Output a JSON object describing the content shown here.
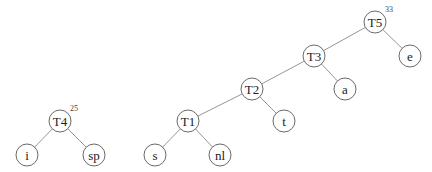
{
  "diagram": {
    "type": "huffman-trees",
    "nodes": [
      {
        "id": "T5",
        "label": "T5",
        "x": 375,
        "y": 22,
        "weight": "33"
      },
      {
        "id": "T3",
        "label": "T3",
        "x": 314,
        "y": 56
      },
      {
        "id": "e",
        "label": "e",
        "x": 410,
        "y": 56
      },
      {
        "id": "T2",
        "label": "T2",
        "x": 252,
        "y": 89
      },
      {
        "id": "a",
        "label": "a",
        "x": 345,
        "y": 89
      },
      {
        "id": "T1",
        "label": "T1",
        "x": 188,
        "y": 121
      },
      {
        "id": "t",
        "label": "t",
        "x": 284,
        "y": 121
      },
      {
        "id": "s",
        "label": "s",
        "x": 155,
        "y": 155
      },
      {
        "id": "nl",
        "label": "nl",
        "x": 220,
        "y": 155
      },
      {
        "id": "T4",
        "label": "T4",
        "x": 60,
        "y": 121,
        "weight": "25"
      },
      {
        "id": "i",
        "label": "i",
        "x": 27,
        "y": 155
      },
      {
        "id": "sp",
        "label": "sp",
        "x": 94,
        "y": 155
      }
    ],
    "edges": [
      [
        "T5",
        "T3"
      ],
      [
        "T5",
        "e"
      ],
      [
        "T3",
        "T2"
      ],
      [
        "T3",
        "a"
      ],
      [
        "T2",
        "T1"
      ],
      [
        "T2",
        "t"
      ],
      [
        "T1",
        "s"
      ],
      [
        "T1",
        "nl"
      ],
      [
        "T4",
        "i"
      ],
      [
        "T4",
        "sp"
      ]
    ],
    "radius": 11
  }
}
